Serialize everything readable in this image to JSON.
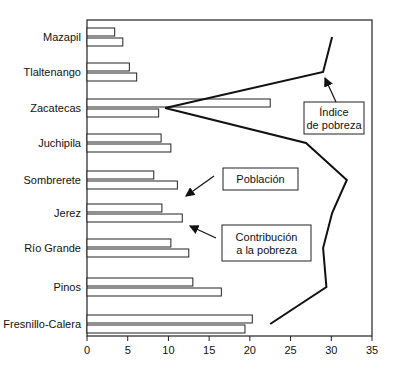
{
  "chart_data": {
    "type": "bar",
    "orientation": "horizontal",
    "title": "",
    "xlabel": "",
    "ylabel": "",
    "xlim": [
      0,
      35
    ],
    "x_ticks": [
      0,
      5,
      10,
      15,
      20,
      25,
      30,
      35
    ],
    "grid": false,
    "categories": [
      "Mazapil",
      "Tlaltenango",
      "Zacatecas",
      "Juchipila",
      "Sombrerete",
      "Jerez",
      "Río Grande",
      "Pinos",
      "Fresnillo-Calera"
    ],
    "series": [
      {
        "name": "Población",
        "kind": "bar",
        "values": [
          3.4,
          5.2,
          22.5,
          9.1,
          8.2,
          9.2,
          10.3,
          13.0,
          20.3
        ]
      },
      {
        "name": "Contribución a la pobreza",
        "kind": "bar",
        "values": [
          4.4,
          6.1,
          8.8,
          10.3,
          11.1,
          11.7,
          12.5,
          16.5,
          19.4
        ]
      },
      {
        "name": "Índice de pobreza",
        "kind": "line",
        "values": [
          30.1,
          29.0,
          9.6,
          26.9,
          31.9,
          30.1,
          29.0,
          29.4,
          22.5
        ]
      }
    ],
    "annotations": [
      {
        "text": [
          "Índice",
          "de pobreza"
        ],
        "points_to": "Índice de pobreza line"
      },
      {
        "text": [
          "Población"
        ],
        "points_to": "Población bar"
      },
      {
        "text": [
          "Contribución",
          "a la pobreza"
        ],
        "points_to": "Contribución a la pobreza bar"
      }
    ]
  },
  "colors": {
    "stroke": "#222222",
    "bar_fill": "#ffffff",
    "background": "#ffffff"
  }
}
